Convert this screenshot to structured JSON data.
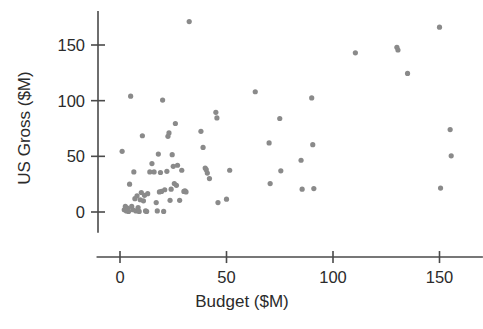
{
  "chart_data": {
    "type": "scatter",
    "title": "",
    "xlabel": "Budget ($M)",
    "ylabel": "US Gross ($M)",
    "xlim": [
      -5,
      170
    ],
    "ylim": [
      -18,
      178
    ],
    "xticks": [
      0,
      50,
      100,
      150
    ],
    "xtick_labels": [
      "0",
      "50",
      "100",
      "150"
    ],
    "yticks": [
      0,
      50,
      100,
      150
    ],
    "ytick_labels": [
      "0",
      "50",
      "100",
      "150"
    ],
    "grid": false,
    "legend": "none",
    "marker": {
      "shape": "circle",
      "color": "#8a8a8a",
      "size": 5.2
    },
    "series": [
      {
        "name": "films",
        "points": [
          [
            1.0,
            54.5
          ],
          [
            2.0,
            2.0
          ],
          [
            2.5,
            5.0
          ],
          [
            3.0,
            1.0
          ],
          [
            3.5,
            3.5
          ],
          [
            4.0,
            0.5
          ],
          [
            4.5,
            25.0
          ],
          [
            5.0,
            104.0
          ],
          [
            5.5,
            5.0
          ],
          [
            6.0,
            2.0
          ],
          [
            6.5,
            36.0
          ],
          [
            7.0,
            12.0
          ],
          [
            7.5,
            1.0
          ],
          [
            8.0,
            14.5
          ],
          [
            8.5,
            4.0
          ],
          [
            9.0,
            0.5
          ],
          [
            9.5,
            11.0
          ],
          [
            10.0,
            17.5
          ],
          [
            10.5,
            68.5
          ],
          [
            11.0,
            10.0
          ],
          [
            11.5,
            15.0
          ],
          [
            12.0,
            1.0
          ],
          [
            12.5,
            0.5
          ],
          [
            13.0,
            16.5
          ],
          [
            14.0,
            36.0
          ],
          [
            15.0,
            43.5
          ],
          [
            16.0,
            36.0
          ],
          [
            17.0,
            8.5
          ],
          [
            17.5,
            1.0
          ],
          [
            18.0,
            52.0
          ],
          [
            18.5,
            18.0
          ],
          [
            19.0,
            35.5
          ],
          [
            19.5,
            18.5
          ],
          [
            20.0,
            100.5
          ],
          [
            20.5,
            0.5
          ],
          [
            21.0,
            20.0
          ],
          [
            22.0,
            36.5
          ],
          [
            22.5,
            68.0
          ],
          [
            23.0,
            71.0
          ],
          [
            23.5,
            10.5
          ],
          [
            24.0,
            20.5
          ],
          [
            24.5,
            51.5
          ],
          [
            25.0,
            41.0
          ],
          [
            25.5,
            25.5
          ],
          [
            26.0,
            79.5
          ],
          [
            26.5,
            24.0
          ],
          [
            27.0,
            42.0
          ],
          [
            28.0,
            10.5
          ],
          [
            29.0,
            37.5
          ],
          [
            30.0,
            18.5
          ],
          [
            30.5,
            19.0
          ],
          [
            31.0,
            18.0
          ],
          [
            32.5,
            171.0
          ],
          [
            38.0,
            72.5
          ],
          [
            39.0,
            58.0
          ],
          [
            40.0,
            39.5
          ],
          [
            40.5,
            38.0
          ],
          [
            41.0,
            35.0
          ],
          [
            42.0,
            30.0
          ],
          [
            45.0,
            89.5
          ],
          [
            45.5,
            84.5
          ],
          [
            46.0,
            8.5
          ],
          [
            50.0,
            11.5
          ],
          [
            51.5,
            37.5
          ],
          [
            63.5,
            108.0
          ],
          [
            70.0,
            62.0
          ],
          [
            70.5,
            25.5
          ],
          [
            75.0,
            84.0
          ],
          [
            75.5,
            37.0
          ],
          [
            85.0,
            46.5
          ],
          [
            85.5,
            20.5
          ],
          [
            90.0,
            102.5
          ],
          [
            90.5,
            60.5
          ],
          [
            91.0,
            21.0
          ],
          [
            110.5,
            143.0
          ],
          [
            130.0,
            148.0
          ],
          [
            130.5,
            145.5
          ],
          [
            135.0,
            124.5
          ],
          [
            150.0,
            166.0
          ],
          [
            150.5,
            21.5
          ],
          [
            155.0,
            74.0
          ],
          [
            155.5,
            50.5
          ]
        ]
      }
    ]
  },
  "axis": {
    "x_title": "Budget ($M)",
    "y_title": "US Gross ($M)"
  }
}
